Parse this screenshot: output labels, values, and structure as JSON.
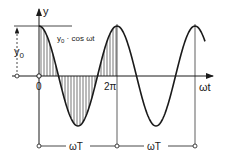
{
  "diagram": {
    "type": "cosine-wave",
    "labels": {
      "y_axis": "y",
      "x_axis": "ωt",
      "amplitude": "y",
      "amplitude_sub": "0",
      "curve_a": "y",
      "curve_sub": "0",
      "curve_b": " · cos ωt",
      "origin": "0",
      "two_pi": "2π",
      "period_1": "ωT",
      "period_2": "ωT"
    },
    "colors": {
      "ink": "#1a1a1a",
      "background": "#ffffff"
    }
  }
}
